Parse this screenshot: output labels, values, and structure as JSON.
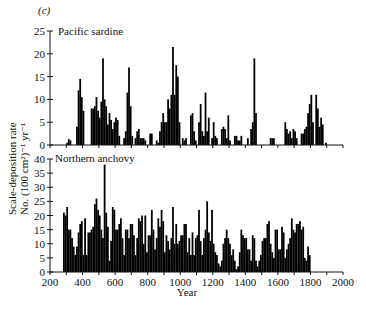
{
  "figure": {
    "panel_label": "(c)",
    "ylabel_line1": "Scale-deposition rate",
    "ylabel_line2": "No. (100 cm²)⁻¹ yr⁻¹",
    "xlabel": "Year",
    "bar_color": "#000000"
  },
  "chart_data": [
    {
      "type": "bar",
      "title": "Pacific sardine",
      "xlabel": "Year",
      "ylabel": "Scale-deposition rate No. (100 cm²)⁻¹ yr⁻¹",
      "xlim": [
        200,
        2000
      ],
      "ylim": [
        0,
        25
      ],
      "yticks": [
        0,
        5,
        10,
        15,
        20,
        25
      ],
      "xticks": [
        200,
        400,
        600,
        800,
        1000,
        1200,
        1400,
        1600,
        1800,
        2000
      ],
      "bin_width": 10,
      "x": [
        300,
        310,
        320,
        330,
        340,
        350,
        360,
        370,
        380,
        390,
        400,
        410,
        420,
        430,
        440,
        450,
        460,
        470,
        480,
        490,
        500,
        510,
        520,
        530,
        540,
        550,
        560,
        570,
        580,
        590,
        600,
        610,
        620,
        630,
        640,
        650,
        660,
        670,
        680,
        690,
        700,
        710,
        720,
        730,
        740,
        750,
        760,
        770,
        780,
        790,
        800,
        810,
        820,
        830,
        840,
        850,
        860,
        870,
        880,
        890,
        900,
        910,
        920,
        930,
        940,
        950,
        960,
        970,
        980,
        990,
        1000,
        1010,
        1020,
        1030,
        1040,
        1050,
        1060,
        1070,
        1080,
        1090,
        1100,
        1110,
        1120,
        1130,
        1140,
        1150,
        1160,
        1170,
        1180,
        1190,
        1200,
        1210,
        1220,
        1230,
        1240,
        1250,
        1260,
        1270,
        1280,
        1290,
        1300,
        1310,
        1320,
        1330,
        1340,
        1350,
        1360,
        1370,
        1380,
        1390,
        1400,
        1410,
        1420,
        1430,
        1440,
        1450,
        1460,
        1470,
        1480,
        1490,
        1500,
        1510,
        1520,
        1530,
        1540,
        1550,
        1560,
        1570,
        1580,
        1590,
        1600,
        1610,
        1620,
        1630,
        1640,
        1650,
        1660,
        1670,
        1680,
        1690,
        1700,
        1710,
        1720,
        1730,
        1740,
        1750,
        1760,
        1770,
        1780,
        1790,
        1800,
        1810,
        1820,
        1830,
        1840,
        1850,
        1860,
        1870,
        1880,
        1890,
        1900,
        1910,
        1920,
        1930,
        1940,
        1950,
        1960,
        1970
      ],
      "values": [
        0.5,
        1.3,
        1,
        0,
        0,
        0,
        4,
        12,
        14.5,
        10.5,
        7.5,
        0,
        0,
        0,
        0,
        8,
        8,
        8.5,
        10.5,
        7.5,
        6,
        9.5,
        19,
        10,
        8.5,
        4.5,
        7,
        5.5,
        3.5,
        5,
        6,
        5.5,
        2,
        0,
        0,
        1.5,
        3,
        11.5,
        17,
        8.5,
        2,
        0,
        1.5,
        3,
        3.5,
        1.5,
        1.5,
        1.5,
        1,
        0,
        0,
        2.5,
        2.5,
        0,
        0,
        1,
        0.5,
        3,
        5,
        7,
        5,
        5,
        10,
        8,
        11,
        21.5,
        11,
        17.5,
        15,
        5,
        0,
        1.5,
        1,
        1.5,
        0,
        0,
        6.5,
        7,
        3,
        1,
        0,
        5,
        9,
        3,
        2,
        11.5,
        3,
        6,
        0,
        1.5,
        5,
        2,
        1.5,
        0,
        0,
        3.5,
        4,
        3.5,
        1.5,
        6.5,
        1,
        0,
        0,
        2,
        2,
        1,
        1,
        2,
        0,
        0,
        0,
        1.5,
        0,
        3.5,
        5,
        19,
        7,
        0,
        0,
        0,
        0,
        0,
        0,
        0,
        0,
        1.5,
        1.5,
        1.5,
        0,
        0,
        0,
        0,
        0,
        0,
        5,
        3.5,
        2.5,
        3,
        1.5,
        3.5,
        3,
        1.5,
        0,
        0,
        2.5,
        2.5,
        3.5,
        4,
        7,
        9,
        11,
        5,
        0,
        11,
        8,
        4,
        6,
        4.5,
        0,
        0.5,
        0
      ]
    },
    {
      "type": "bar",
      "title": "Northern anchovy",
      "xlabel": "Year",
      "ylabel": "Scale-deposition rate No. (100 cm²)⁻¹ yr⁻¹",
      "xlim": [
        200,
        2000
      ],
      "ylim": [
        0,
        40
      ],
      "yticks": [
        0,
        5,
        10,
        15,
        20,
        25,
        30,
        35,
        40
      ],
      "xticks": [
        200,
        400,
        600,
        800,
        1000,
        1200,
        1400,
        1600,
        1800,
        2000
      ],
      "bin_width": 10,
      "x": [
        280,
        290,
        300,
        310,
        320,
        330,
        340,
        350,
        360,
        370,
        380,
        390,
        400,
        410,
        420,
        430,
        440,
        450,
        460,
        470,
        480,
        490,
        500,
        510,
        520,
        530,
        540,
        550,
        560,
        570,
        580,
        590,
        600,
        610,
        620,
        630,
        640,
        650,
        660,
        670,
        680,
        690,
        700,
        710,
        720,
        730,
        740,
        750,
        760,
        770,
        780,
        790,
        800,
        810,
        820,
        830,
        840,
        850,
        860,
        870,
        880,
        890,
        900,
        910,
        920,
        930,
        940,
        950,
        960,
        970,
        980,
        990,
        1000,
        1010,
        1020,
        1030,
        1040,
        1050,
        1060,
        1070,
        1080,
        1090,
        1100,
        1110,
        1120,
        1130,
        1140,
        1150,
        1160,
        1170,
        1180,
        1190,
        1200,
        1210,
        1220,
        1230,
        1240,
        1250,
        1260,
        1270,
        1280,
        1290,
        1300,
        1310,
        1320,
        1330,
        1340,
        1350,
        1360,
        1370,
        1380,
        1390,
        1400,
        1410,
        1420,
        1430,
        1440,
        1450,
        1460,
        1470,
        1480,
        1490,
        1500,
        1510,
        1520,
        1530,
        1540,
        1550,
        1560,
        1570,
        1580,
        1590,
        1600,
        1610,
        1620,
        1630,
        1640,
        1650,
        1660,
        1670,
        1680,
        1690,
        1700,
        1710,
        1720,
        1730,
        1740,
        1750,
        1760,
        1770,
        1780,
        1790,
        1800,
        1810,
        1820,
        1830,
        1840,
        1850,
        1860,
        1870,
        1880,
        1890,
        1900,
        1910,
        1920,
        1930,
        1940,
        1950,
        1960,
        1970
      ],
      "values": [
        21,
        20,
        23,
        15,
        15,
        12,
        9,
        6,
        9,
        14,
        17,
        18,
        6,
        19,
        6,
        14,
        14,
        15,
        16,
        24,
        26,
        22,
        20,
        15,
        12,
        38,
        21,
        16,
        4,
        11,
        23,
        22,
        15,
        15,
        17,
        19,
        12,
        6,
        15,
        15,
        12,
        17,
        17,
        13,
        6,
        12,
        19,
        18,
        20,
        10,
        20,
        7,
        13,
        13,
        22,
        15,
        8,
        12,
        19,
        16,
        22,
        18,
        7,
        13,
        11,
        8,
        12,
        23,
        10,
        17,
        10,
        11,
        13,
        13,
        17,
        17,
        7,
        12,
        6,
        14,
        6,
        12,
        13,
        22,
        11,
        6,
        12,
        15,
        25,
        14,
        11,
        22,
        10,
        7,
        6,
        3,
        2,
        4,
        10,
        12,
        15,
        12,
        10,
        6,
        8,
        4,
        1,
        2,
        7,
        15,
        13,
        12,
        12,
        8,
        8,
        4,
        13,
        12,
        4,
        2,
        4,
        6,
        11,
        12,
        12,
        17,
        18,
        10,
        7,
        5,
        15,
        15,
        8,
        8,
        16,
        14,
        5,
        8,
        10,
        12,
        19,
        15,
        14,
        17,
        17,
        18,
        15,
        16,
        5,
        4,
        9,
        6
      ]
    }
  ]
}
